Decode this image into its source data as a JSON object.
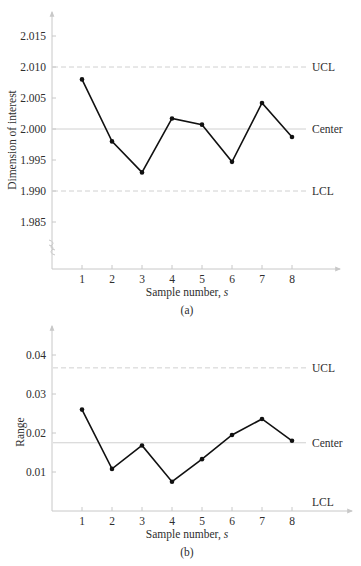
{
  "chart_data": [
    {
      "id": "a",
      "type": "line",
      "caption": "(a)",
      "title": "",
      "xlabel": "Sample number, s",
      "xlabel_main": "Sample number, ",
      "xlabel_var": "s",
      "ylabel": "Dimension of interest",
      "x": [
        1,
        2,
        3,
        4,
        5,
        6,
        7,
        8
      ],
      "x_tick_labels": [
        "1",
        "2",
        "3",
        "4",
        "5",
        "6",
        "7",
        "8"
      ],
      "y_tick_labels": [
        "2.015",
        "2.010",
        "2.005",
        "2.000",
        "1.995",
        "1.990",
        "1.985"
      ],
      "y_ticks": [
        2.015,
        2.01,
        2.005,
        2.0,
        1.995,
        1.99,
        1.985
      ],
      "series": [
        {
          "name": "Sample mean",
          "values": [
            2.008,
            1.998,
            1.993,
            2.0017,
            2.0007,
            1.9947,
            2.0042,
            1.9987
          ]
        }
      ],
      "control_lines": [
        {
          "label": "UCL",
          "value": 2.01,
          "style": "dashed"
        },
        {
          "label": "Center",
          "value": 2.0,
          "style": "solid"
        },
        {
          "label": "LCL",
          "value": 1.99,
          "style": "dashed"
        }
      ],
      "axis_break": true,
      "ylim": [
        1.978,
        2.019
      ],
      "grid": false,
      "legend": "none"
    },
    {
      "id": "b",
      "type": "line",
      "caption": "(b)",
      "title": "",
      "xlabel": "Sample number, s",
      "xlabel_main": "Sample number, ",
      "xlabel_var": "s",
      "ylabel": "Range",
      "x": [
        1,
        2,
        3,
        4,
        5,
        6,
        7,
        8
      ],
      "x_tick_labels": [
        "1",
        "2",
        "3",
        "4",
        "5",
        "6",
        "7",
        "8"
      ],
      "y_tick_labels": [
        "0.04",
        "0.03",
        "0.02",
        "0.01"
      ],
      "y_ticks": [
        0.04,
        0.03,
        0.02,
        0.01
      ],
      "series": [
        {
          "name": "Sample range",
          "values": [
            0.026,
            0.0108,
            0.0168,
            0.0075,
            0.0133,
            0.0195,
            0.0236,
            0.018
          ]
        }
      ],
      "control_lines": [
        {
          "label": "UCL",
          "value": 0.0367,
          "style": "dashed"
        },
        {
          "label": "Center",
          "value": 0.0175,
          "style": "solid"
        },
        {
          "label": "LCL",
          "value": 0.0,
          "style": "axis"
        }
      ],
      "ylim": [
        0,
        0.047
      ],
      "grid": false,
      "legend": "none"
    }
  ],
  "style": {
    "line_color": "#111111",
    "axis_color": "#c8c8c8",
    "control_line_color": "#d0d0d0",
    "text_color": "#2e2e2e"
  }
}
